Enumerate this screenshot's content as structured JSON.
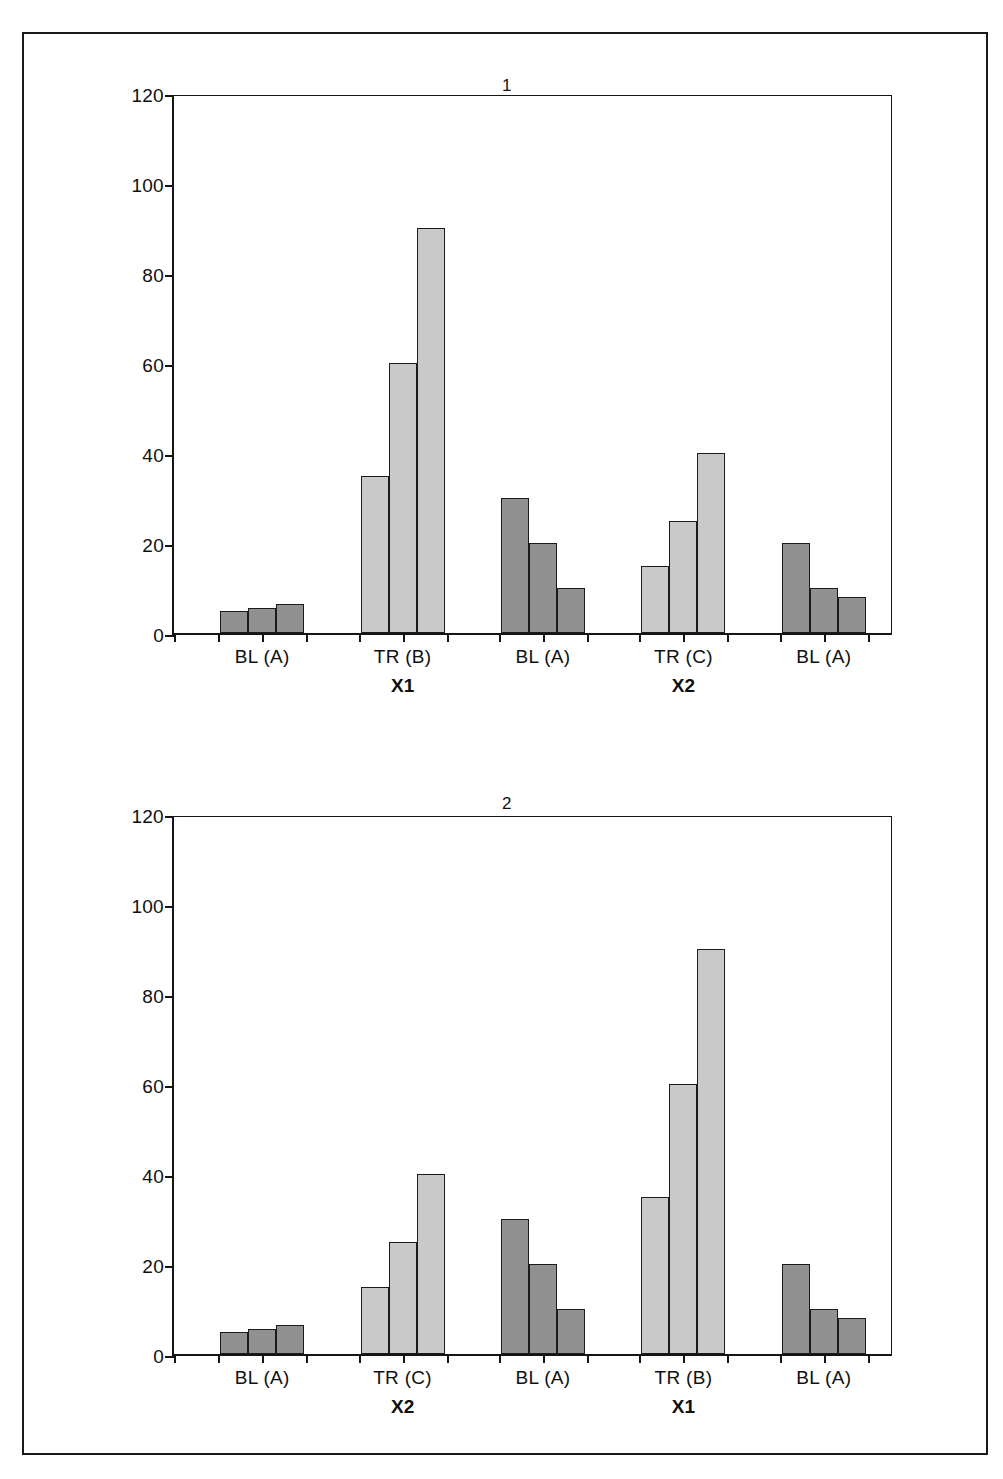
{
  "figure": {
    "background": "#ffffff",
    "border_color": "#1a1a1a"
  },
  "panels": [
    {
      "title": "1",
      "y_axis": {
        "ticks": [
          "0",
          "20",
          "40",
          "60",
          "80",
          "100",
          "120"
        ],
        "min": 0,
        "max": 120
      },
      "group_labels": [
        "BL (A)",
        "TR (B)",
        "BL (A)",
        "TR (C)",
        "BL (A)"
      ],
      "sub_labels": [
        "",
        "X1",
        "",
        "X2",
        ""
      ]
    },
    {
      "title": "2",
      "y_axis": {
        "ticks": [
          "0",
          "20",
          "40",
          "60",
          "80",
          "100",
          "120"
        ],
        "min": 0,
        "max": 120
      },
      "group_labels": [
        "BL (A)",
        "TR (C)",
        "BL (A)",
        "TR (B)",
        "BL (A)"
      ],
      "sub_labels": [
        "",
        "X2",
        "",
        "X1",
        ""
      ]
    }
  ],
  "colors": {
    "light_bar": "#c9c9c9",
    "dark_bar": "#919191",
    "bar_outline": "#1b1b1b",
    "axis": "#151515",
    "text": "#101010"
  },
  "chart_data": [
    {
      "type": "bar",
      "title": "1",
      "xlabel": "",
      "ylabel": "",
      "ylim": [
        0,
        120
      ],
      "yticks": [
        0,
        20,
        40,
        60,
        80,
        100,
        120
      ],
      "grid": false,
      "legend": "none",
      "categories": [
        "BL (A)",
        "TR (B)",
        "BL (A)",
        "TR (C)",
        "BL (A)"
      ],
      "group_sublabels": [
        "",
        "X1",
        "",
        "X2",
        ""
      ],
      "groups": [
        {
          "label": "BL (A)",
          "sublabel": "",
          "shade": "dark",
          "values": [
            5,
            5.5,
            6.5
          ]
        },
        {
          "label": "TR (B)",
          "sublabel": "X1",
          "shade": "light",
          "values": [
            35,
            60,
            90
          ]
        },
        {
          "label": "BL (A)",
          "sublabel": "",
          "shade": "dark",
          "values": [
            30,
            20,
            10
          ]
        },
        {
          "label": "TR (C)",
          "sublabel": "X2",
          "shade": "light",
          "values": [
            15,
            25,
            40
          ]
        },
        {
          "label": "BL (A)",
          "sublabel": "",
          "shade": "dark",
          "values": [
            20,
            10,
            8
          ]
        }
      ]
    },
    {
      "type": "bar",
      "title": "2",
      "xlabel": "",
      "ylabel": "",
      "ylim": [
        0,
        120
      ],
      "yticks": [
        0,
        20,
        40,
        60,
        80,
        100,
        120
      ],
      "grid": false,
      "legend": "none",
      "categories": [
        "BL (A)",
        "TR (C)",
        "BL (A)",
        "TR (B)",
        "BL (A)"
      ],
      "group_sublabels": [
        "",
        "X2",
        "",
        "X1",
        ""
      ],
      "groups": [
        {
          "label": "BL (A)",
          "sublabel": "",
          "shade": "dark",
          "values": [
            5,
            5.5,
            6.5
          ]
        },
        {
          "label": "TR (C)",
          "sublabel": "X2",
          "shade": "light",
          "values": [
            15,
            25,
            40
          ]
        },
        {
          "label": "BL (A)",
          "sublabel": "",
          "shade": "dark",
          "values": [
            30,
            20,
            10
          ]
        },
        {
          "label": "TR (B)",
          "sublabel": "X1",
          "shade": "light",
          "values": [
            35,
            60,
            90
          ]
        },
        {
          "label": "BL (A)",
          "sublabel": "",
          "shade": "dark",
          "values": [
            20,
            10,
            8
          ]
        }
      ]
    }
  ]
}
